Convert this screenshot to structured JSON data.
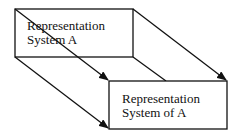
{
  "diagram": {
    "box_a": {
      "line1": "Representation",
      "line2": "System A"
    },
    "box_of_a": {
      "line1": "Representation",
      "line2": "System of A"
    },
    "colors": {
      "stroke": "#111111",
      "background": "#ffffff"
    },
    "arrows": [
      {
        "from": "box_a.top-left",
        "to": "box_of_a.top-left"
      },
      {
        "from": "box_a.top-right",
        "to": "box_of_a.top-right"
      },
      {
        "from": "box_a.bottom-left",
        "to": "box_of_a.bottom-left"
      },
      {
        "from": "box_a.bottom-right",
        "to": "box_of_a.bottom-right"
      }
    ]
  }
}
